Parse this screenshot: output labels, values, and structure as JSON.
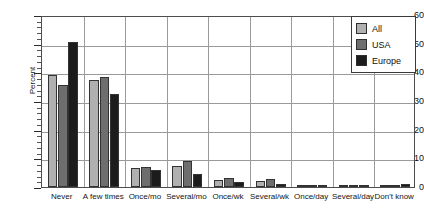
{
  "chart_data": {
    "type": "bar",
    "title": "",
    "xlabel": "",
    "ylabel": "Percent",
    "ylim": [
      0,
      60
    ],
    "ytick_step": 10,
    "yminor_step": 2,
    "grid": true,
    "legend_position": "top-right",
    "categories": [
      "Never",
      "A few times",
      "Once/mo",
      "Several/mo",
      "Once/wk",
      "Several/wk",
      "Once/day",
      "Several/day",
      "Don't know"
    ],
    "ytick_labels": [
      "0",
      "10",
      "20",
      "30",
      "40",
      "50",
      "60"
    ],
    "series": [
      {
        "name": "All",
        "color": "#b0b0b0",
        "values": [
          39,
          37.5,
          6.5,
          7.5,
          2.5,
          2.2,
          0.5,
          0.2,
          0.3
        ]
      },
      {
        "name": "USA",
        "color": "#6e6e6e",
        "values": [
          35.5,
          38.5,
          7,
          9,
          3,
          2.8,
          0.6,
          0.3,
          0.4
        ]
      },
      {
        "name": "Europe",
        "color": "#1c1c1c",
        "values": [
          50.5,
          32.5,
          6,
          4.5,
          1.8,
          1,
          0.3,
          0.2,
          0.9
        ]
      }
    ]
  },
  "legend": {
    "items": [
      {
        "label": "All",
        "color": "#b0b0b0"
      },
      {
        "label": "USA",
        "color": "#6e6e6e"
      },
      {
        "label": "Europe",
        "color": "#1c1c1c"
      }
    ]
  }
}
